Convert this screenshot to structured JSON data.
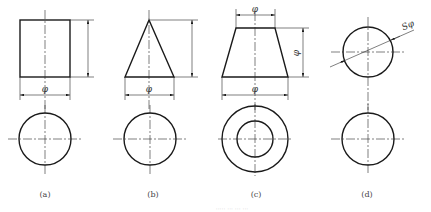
{
  "figure": {
    "line_color": "#1a1a1a",
    "background": "#ffffff",
    "views": [
      {
        "id": "a",
        "label": "(a)",
        "solid": "cylinder",
        "dimensions": [
          "φ",
          "height"
        ]
      },
      {
        "id": "b",
        "label": "(b)",
        "solid": "cone",
        "dimensions": [
          "φ",
          "height"
        ]
      },
      {
        "id": "c",
        "label": "(c)",
        "solid": "truncated-cone",
        "dimensions": [
          "φ",
          "φ",
          "φ"
        ]
      },
      {
        "id": "d",
        "label": "(d)",
        "solid": "sphere",
        "dimensions": [
          "Sφ"
        ]
      }
    ],
    "dim_symbols": {
      "diameter": "φ",
      "sphere_diameter": "Sφ"
    },
    "caption": "····· ··· ··· ···"
  }
}
